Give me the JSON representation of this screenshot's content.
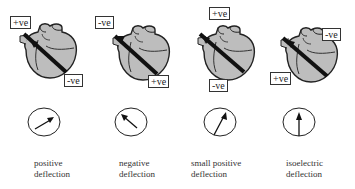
{
  "diagram": {
    "panels": [
      {
        "id": "positive",
        "top_label": "+ve",
        "bottom_label": "-ve",
        "caption_line1": "positive",
        "caption_line2": "deflection",
        "vector_angle_deg": 30
      },
      {
        "id": "negative",
        "top_label": "-ve",
        "bottom_label": "+ve",
        "caption_line1": "negative",
        "caption_line2": "deflection",
        "vector_angle_deg": 145
      },
      {
        "id": "small-positive",
        "top_label": "+ve",
        "bottom_label": "-ve",
        "caption_line1": "small positive",
        "caption_line2": "deflection",
        "vector_angle_deg": 60
      },
      {
        "id": "isoelectric",
        "top_label": "-ve",
        "bottom_label": "+ve",
        "caption_line1": "isoelectric",
        "caption_line2": "deflection",
        "vector_angle_deg": 90
      }
    ],
    "colors": {
      "heart_fill": "#bdbdbd",
      "outline": "#222222",
      "electrode": "#111111"
    }
  }
}
